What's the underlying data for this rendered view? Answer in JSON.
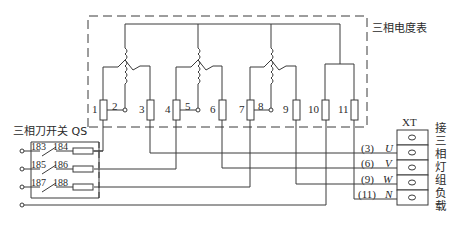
{
  "meter": {
    "title": "三相电度表",
    "terminals": [
      "1",
      "2",
      "3",
      "4",
      "5",
      "6",
      "7",
      "8",
      "9",
      "10",
      "11"
    ]
  },
  "switch": {
    "title": "三相刀开关 QS",
    "contacts": [
      {
        "in": "183",
        "out": "184"
      },
      {
        "in": "185",
        "out": "186"
      },
      {
        "in": "187",
        "out": "188"
      }
    ]
  },
  "terminal_block": {
    "title": "XT",
    "rows": [
      {
        "num": "(3)",
        "phase": "U"
      },
      {
        "num": "(6)",
        "phase": "V"
      },
      {
        "num": "(9)",
        "phase": "W"
      },
      {
        "num": "(11)",
        "phase": "N"
      }
    ],
    "load_label": "接三相灯组负载",
    "load_chars": [
      "接",
      "三",
      "相",
      "灯",
      "组",
      "负",
      "载"
    ]
  },
  "colors": {
    "line": "#3a3a3a",
    "background": "#ffffff"
  }
}
